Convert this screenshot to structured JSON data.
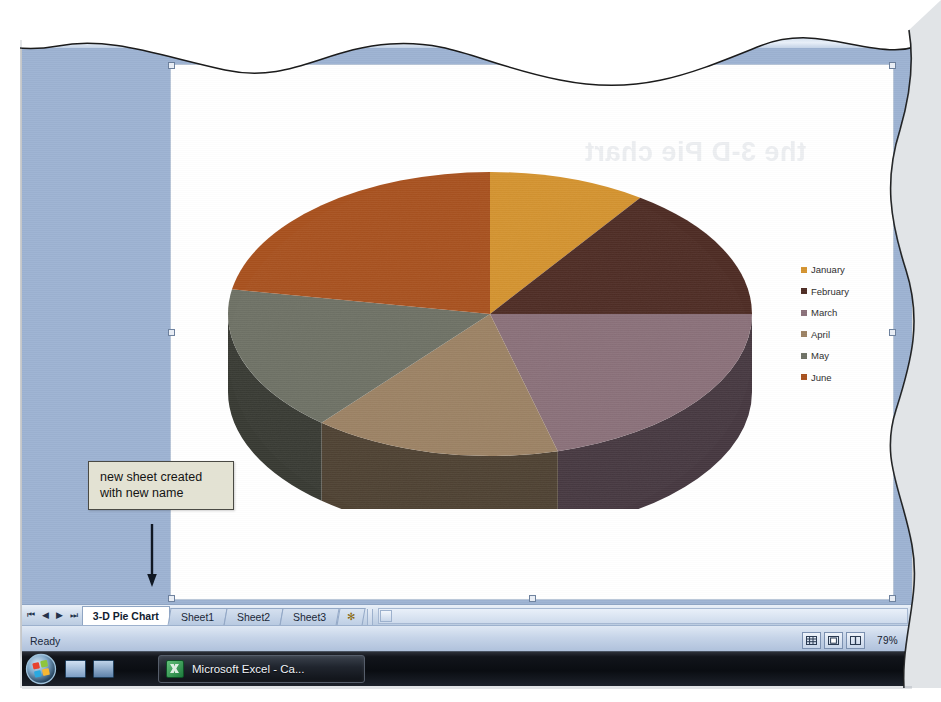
{
  "application": {
    "name": "Microsoft Excel",
    "window_title": "Microsoft Excel - Ca...",
    "formula_bar": {
      "name_box_arrow": "▼",
      "fx_symbol": "fx"
    }
  },
  "ghost_text": "the 3-D Pie chart",
  "chart": {
    "title": "",
    "legend_position": "right"
  },
  "chart_data": {
    "type": "pie",
    "title": "",
    "subtitle": "",
    "xlabel": "",
    "ylabel": "",
    "three_d": true,
    "legend_position": "right",
    "grid": false,
    "categories": [
      "January",
      "February",
      "March",
      "April",
      "May",
      "June"
    ],
    "values": [
      9.7,
      15.3,
      20.8,
      15.3,
      16.7,
      22.2
    ],
    "angles_deg": [
      35,
      55,
      75,
      55,
      60,
      80
    ],
    "start_angle_deg": 0,
    "colors": [
      "#d4932f",
      "#4e2c24",
      "#8a7079",
      "#9c8264",
      "#6e7165",
      "#a8511e"
    ],
    "side_colors": [
      "#6a4a17",
      "#241310",
      "#463840",
      "#4e4132",
      "#383a33",
      "#54280f"
    ],
    "legend_entries": [
      {
        "label": "January",
        "color": "#d4932f"
      },
      {
        "label": "February",
        "color": "#4e2c24"
      },
      {
        "label": "March",
        "color": "#8a7079"
      },
      {
        "label": "April",
        "color": "#9c8264"
      },
      {
        "label": "May",
        "color": "#6e7165"
      },
      {
        "label": "June",
        "color": "#a8511e"
      }
    ]
  },
  "sheet_tabs": {
    "nav": {
      "first": "⏮",
      "previous": "◀",
      "next": "▶",
      "last": "⏭"
    },
    "tabs": [
      {
        "label": "3-D Pie Chart",
        "active": true
      },
      {
        "label": "Sheet1",
        "active": false
      },
      {
        "label": "Sheet2",
        "active": false
      },
      {
        "label": "Sheet3",
        "active": false
      }
    ],
    "insert_sheet_label": "✻"
  },
  "status_bar": {
    "mode": "Ready",
    "views": [
      {
        "name": "normal-view",
        "label": "▦"
      },
      {
        "name": "page-layout-view",
        "label": "▣"
      },
      {
        "name": "page-break-preview",
        "label": "▥"
      }
    ],
    "zoom_level": "79%"
  },
  "annotation": {
    "callout_text": "new sheet created with new name",
    "callout_bg": "#e3e2d3",
    "callout_border": "#4a4a44"
  },
  "taskbar": {
    "start_button": "start-orb",
    "quick_launch": [
      "show-desktop-icon",
      "media-player-icon"
    ],
    "window_button_label": "Microsoft Excel - Ca..."
  }
}
